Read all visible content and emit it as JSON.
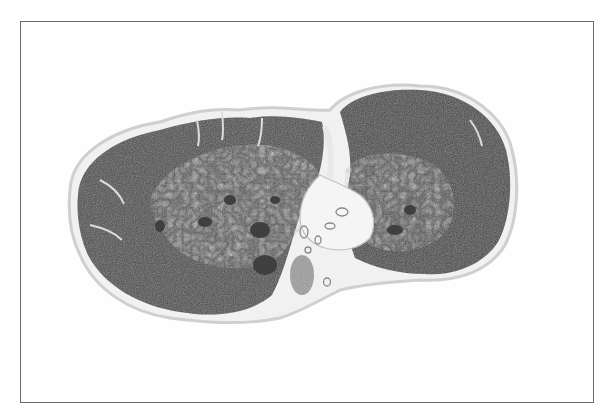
{
  "figure": {
    "kind": "grayscale micrograph",
    "frame": {
      "border_color": "#6a6a6a",
      "background": "#fefefe"
    },
    "colors": {
      "dark_tissue": "#4a4a4a",
      "mid_tissue": "#7a7a7a",
      "light_tissue": "#b8b8b8",
      "membrane": "#d8d8d8",
      "vessel": "#9a9a9a"
    }
  }
}
